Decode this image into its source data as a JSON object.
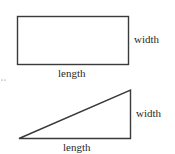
{
  "rectangle": {
    "width_label": "width",
    "length_label": "length"
  },
  "triangle": {
    "width_label": "width",
    "length_label": "length"
  },
  "margin_mark": "..",
  "colors": {
    "stroke": "#3a3a3a",
    "text": "#2a2a2a",
    "background": "#ffffff"
  }
}
